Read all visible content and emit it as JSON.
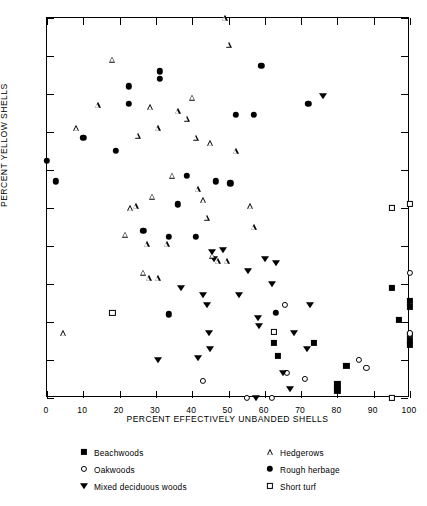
{
  "chart_data": {
    "type": "scatter",
    "title": "",
    "xlabel": "PERCENT EFFECTIVELY UNBANDED SHELLS",
    "ylabel": "PERCENT YELLOW SHELLS",
    "xlim": [
      0,
      100
    ],
    "ylim": [
      0,
      100
    ],
    "xticks": [
      0,
      10,
      20,
      30,
      40,
      50,
      60,
      70,
      80,
      90,
      100
    ],
    "yticks": [
      0,
      10,
      20,
      30,
      40,
      50,
      60,
      70,
      80,
      90,
      100
    ],
    "grid": false,
    "legend_position": "below-axes",
    "series": [
      {
        "name": "Beachwoods",
        "marker": "filled-square",
        "points": [
          [
            62.5,
            14.5
          ],
          [
            63.5,
            11.0
          ],
          [
            73.5,
            14.5
          ],
          [
            80.0,
            2.0
          ],
          [
            80.0,
            3.6
          ],
          [
            82.5,
            8.5
          ],
          [
            95.0,
            29.0
          ],
          [
            97.0,
            20.5
          ],
          [
            100.0,
            25.5
          ],
          [
            100.0,
            24.0
          ],
          [
            100.0,
            16.5
          ],
          [
            100.0,
            15.0
          ],
          [
            100.0,
            14.0
          ]
        ]
      },
      {
        "name": "Oakwoods",
        "marker": "open-circle",
        "points": [
          [
            43.0,
            4.5
          ],
          [
            55.0,
            0.0
          ],
          [
            62.0,
            0.0
          ],
          [
            65.5,
            24.5
          ],
          [
            66.0,
            6.5
          ],
          [
            71.0,
            5.0
          ],
          [
            86.0,
            10.0
          ],
          [
            88.0,
            8.0
          ],
          [
            100.0,
            17.0
          ],
          [
            100.0,
            33.0
          ]
        ]
      },
      {
        "name": "Mixed deciduous woods",
        "marker": "filled-dtriangle",
        "points": [
          [
            30.5,
            10.0
          ],
          [
            37.0,
            29.0
          ],
          [
            41.5,
            10.5
          ],
          [
            43.0,
            27.0
          ],
          [
            44.0,
            24.5
          ],
          [
            44.5,
            17.0
          ],
          [
            45.0,
            13.0
          ],
          [
            45.5,
            38.5
          ],
          [
            46.0,
            36.5
          ],
          [
            48.5,
            39.0
          ],
          [
            53.0,
            27.0
          ],
          [
            55.5,
            33.5
          ],
          [
            57.5,
            0.0
          ],
          [
            58.0,
            21.0
          ],
          [
            58.5,
            19.0
          ],
          [
            60.0,
            36.5
          ],
          [
            62.0,
            30.0
          ],
          [
            63.0,
            35.5
          ],
          [
            65.0,
            6.5
          ],
          [
            67.0,
            2.5
          ],
          [
            68.0,
            17.0
          ],
          [
            71.5,
            13.0
          ],
          [
            72.5,
            24.5
          ],
          [
            76.0,
            79.5
          ]
        ]
      },
      {
        "name": "Hedgerows",
        "marker": "open-triangle",
        "points": [
          [
            4.5,
            17.0
          ],
          [
            8.0,
            71.0
          ],
          [
            14.0,
            77.0
          ],
          [
            18.0,
            89.0
          ],
          [
            21.5,
            43.0
          ],
          [
            23.0,
            50.0
          ],
          [
            24.5,
            50.5
          ],
          [
            25.0,
            69.0
          ],
          [
            26.5,
            33.0
          ],
          [
            27.5,
            40.5
          ],
          [
            28.0,
            31.5
          ],
          [
            28.5,
            76.5
          ],
          [
            29.0,
            53.0
          ],
          [
            30.5,
            31.5
          ],
          [
            30.5,
            71.0
          ],
          [
            33.0,
            40.5
          ],
          [
            34.5,
            58.5
          ],
          [
            36.0,
            75.5
          ],
          [
            38.5,
            73.5
          ],
          [
            41.0,
            68.5
          ],
          [
            41.5,
            55.0
          ],
          [
            43.0,
            52.0
          ],
          [
            44.0,
            47.5
          ],
          [
            45.5,
            37.5
          ],
          [
            47.0,
            36.0
          ],
          [
            49.0,
            100.0
          ],
          [
            50.0,
            93.0
          ],
          [
            40.0,
            79.0
          ],
          [
            45.0,
            67.0
          ],
          [
            56.0,
            50.5
          ],
          [
            57.0,
            45.0
          ],
          [
            52.0,
            65.0
          ],
          [
            49.5,
            36.0
          ]
        ]
      },
      {
        "name": "Rough herbage",
        "marker": "filled-circle",
        "points": [
          [
            0.0,
            62.5
          ],
          [
            2.5,
            57.0
          ],
          [
            10.0,
            68.5
          ],
          [
            19.0,
            65.0
          ],
          [
            22.5,
            82.0
          ],
          [
            22.5,
            77.5
          ],
          [
            26.5,
            44.0
          ],
          [
            31.0,
            86.0
          ],
          [
            31.0,
            84.0
          ],
          [
            33.5,
            42.5
          ],
          [
            33.5,
            22.0
          ],
          [
            36.0,
            51.0
          ],
          [
            38.5,
            58.5
          ],
          [
            41.0,
            42.5
          ],
          [
            46.5,
            57.0
          ],
          [
            50.5,
            56.5
          ],
          [
            52.0,
            74.5
          ],
          [
            57.0,
            74.5
          ],
          [
            59.0,
            87.5
          ],
          [
            63.0,
            22.5
          ],
          [
            72.0,
            77.5
          ]
        ]
      },
      {
        "name": "Short turf",
        "marker": "open-square",
        "points": [
          [
            18.0,
            22.5
          ],
          [
            62.5,
            17.5
          ],
          [
            95.0,
            0.0
          ],
          [
            95.0,
            50.0
          ],
          [
            100.0,
            51.0
          ]
        ]
      }
    ]
  },
  "axes": {
    "ylabel": "PERCENT YELLOW SHELLS",
    "xlabel": "PERCENT EFFECTIVELY UNBANDED SHELLS",
    "ytick_labels": [
      "100",
      "90",
      "80",
      "70",
      "60",
      "50",
      "40",
      "30",
      "20",
      "10",
      "0"
    ],
    "xtick_labels": [
      "0",
      "10",
      "20",
      "30",
      "40",
      "50",
      "60",
      "70",
      "80",
      "90",
      "100"
    ]
  },
  "legend": {
    "entries": [
      {
        "label": "Beachwoods",
        "marker": "filled-square",
        "column": "left",
        "row": 0
      },
      {
        "label": "Oakwoods",
        "marker": "open-circle",
        "column": "left",
        "row": 1
      },
      {
        "label": "Mixed deciduous woods",
        "marker": "filled-dtriangle",
        "column": "left",
        "row": 2
      },
      {
        "label": "Hedgerows",
        "marker": "open-triangle",
        "column": "right",
        "row": 0
      },
      {
        "label": "Rough herbage",
        "marker": "filled-circle",
        "column": "right",
        "row": 1
      },
      {
        "label": "Short turf",
        "marker": "open-square",
        "column": "right",
        "row": 2
      }
    ]
  },
  "colors": {
    "ink": "#000000",
    "paper": "#ffffff"
  }
}
